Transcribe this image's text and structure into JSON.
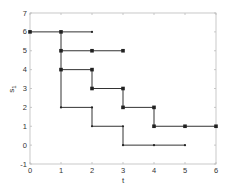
{
  "chart_data": {
    "type": "line",
    "title": "",
    "xlabel": "t",
    "ylabel": "s_1",
    "xlim": [
      0,
      6
    ],
    "ylim": [
      -1,
      7
    ],
    "xticks": [
      0,
      1,
      2,
      3,
      4,
      5,
      6
    ],
    "yticks": [
      -1,
      0,
      1,
      2,
      3,
      4,
      5,
      6,
      7
    ],
    "grid": false,
    "legend": null,
    "series": [
      {
        "name": "path-a",
        "x": [
          0,
          1,
          2
        ],
        "y": [
          6,
          6,
          6
        ],
        "step": false
      },
      {
        "name": "branch-vertical",
        "x": [
          1,
          1
        ],
        "y": [
          6,
          2
        ],
        "step": false
      },
      {
        "name": "path-b",
        "x": [
          1,
          2,
          3
        ],
        "y": [
          5,
          5,
          5
        ],
        "step": false
      },
      {
        "name": "path-c",
        "x": [
          1,
          2,
          2,
          3,
          3,
          4,
          4,
          5,
          6
        ],
        "y": [
          4,
          4,
          3,
          3,
          2,
          2,
          1,
          1,
          1
        ],
        "step": false
      },
      {
        "name": "path-d",
        "x": [
          1,
          2,
          2,
          3,
          3,
          4,
          5
        ],
        "y": [
          2,
          2,
          1,
          1,
          0,
          0,
          0
        ],
        "step": false
      }
    ],
    "markers_large": [
      [
        0,
        6
      ],
      [
        1,
        6
      ],
      [
        1,
        5
      ],
      [
        2,
        5
      ],
      [
        3,
        5
      ],
      [
        1,
        4
      ],
      [
        2,
        4
      ],
      [
        2,
        3
      ],
      [
        3,
        3
      ],
      [
        3,
        2
      ],
      [
        4,
        2
      ],
      [
        4,
        1
      ],
      [
        5,
        1
      ],
      [
        6,
        1
      ]
    ],
    "markers_small": [
      [
        2,
        6
      ],
      [
        1,
        2
      ],
      [
        2,
        2
      ],
      [
        2,
        1
      ],
      [
        3,
        1
      ],
      [
        3,
        0
      ],
      [
        4,
        0
      ],
      [
        5,
        0
      ]
    ]
  },
  "style": {
    "line_color": "#333333",
    "axis_color": "#bbbbbb",
    "marker_color": "#222222"
  }
}
